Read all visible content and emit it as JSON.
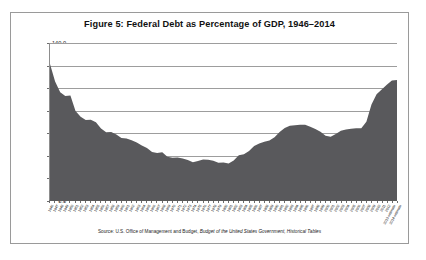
{
  "figure": {
    "title": "Figure 5: Federal Debt as Percentage of GDP, 1946–2014",
    "source_prefix": "Source: U.S. Office of Management and Budget, ",
    "source_italic": "Budget of the United States Government, Historical Tables",
    "border_color": "#9a9a9a",
    "area_color": "#59595c",
    "gridline_color": "#9d9d9d"
  },
  "chart_data": {
    "type": "area",
    "title": "Figure 5: Federal Debt as Percentage of GDP, 1946–2014",
    "xlabel": "",
    "ylabel": "",
    "ylim": [
      0,
      140
    ],
    "ytick_labels": [
      "140.0",
      "120.0",
      "100.0",
      "80.0",
      "60.0",
      "40.0",
      "20.0",
      "0.0"
    ],
    "ytick_values": [
      140,
      120,
      100,
      80,
      60,
      40,
      20,
      0
    ],
    "grid": true,
    "legend": "none",
    "series_name": "Federal debt held as percentage of GDP",
    "categories": [
      "1946",
      "1947",
      "1948",
      "1949",
      "1950",
      "1951",
      "1952",
      "1953",
      "1954",
      "1955",
      "1956",
      "1957",
      "1958",
      "1959",
      "1960",
      "1961",
      "1962",
      "1963",
      "1964",
      "1965",
      "1966",
      "1967",
      "1968",
      "1969",
      "1970",
      "1971",
      "1972",
      "1973",
      "1974",
      "1975",
      "1976",
      "1977",
      "1978",
      "1979",
      "1980",
      "1981",
      "1982",
      "1983",
      "1984",
      "1985",
      "1986",
      "1987",
      "1988",
      "1989",
      "1990",
      "1991",
      "1992",
      "1993",
      "1994",
      "1995",
      "1996",
      "1997",
      "1998",
      "1999",
      "2000",
      "2001",
      "2002",
      "2003",
      "2004",
      "2005",
      "2006",
      "2007",
      "2008",
      "2009",
      "2010",
      "2011",
      "2012",
      "2013 estimate",
      "2014 estimate"
    ],
    "values": [
      121.2,
      105.6,
      96.0,
      92.7,
      93.1,
      79.4,
      74.3,
      71.3,
      71.6,
      69.3,
      63.8,
      60.4,
      60.7,
      58.5,
      55.2,
      54.9,
      53.3,
      51.3,
      48.7,
      46.3,
      42.9,
      41.9,
      42.5,
      38.6,
      37.6,
      37.8,
      37.1,
      35.6,
      33.6,
      34.7,
      36.2,
      35.8,
      35.0,
      33.2,
      33.4,
      32.5,
      35.3,
      39.9,
      40.7,
      43.8,
      48.2,
      50.4,
      51.9,
      53.1,
      55.9,
      60.7,
      64.1,
      66.1,
      66.6,
      67.0,
      67.1,
      65.4,
      63.2,
      60.9,
      57.3,
      56.4,
      58.8,
      61.7,
      62.9,
      63.5,
      63.9,
      64.0,
      69.7,
      85.2,
      94.2,
      98.6,
      102.7,
      106.5,
      107.0
    ]
  }
}
